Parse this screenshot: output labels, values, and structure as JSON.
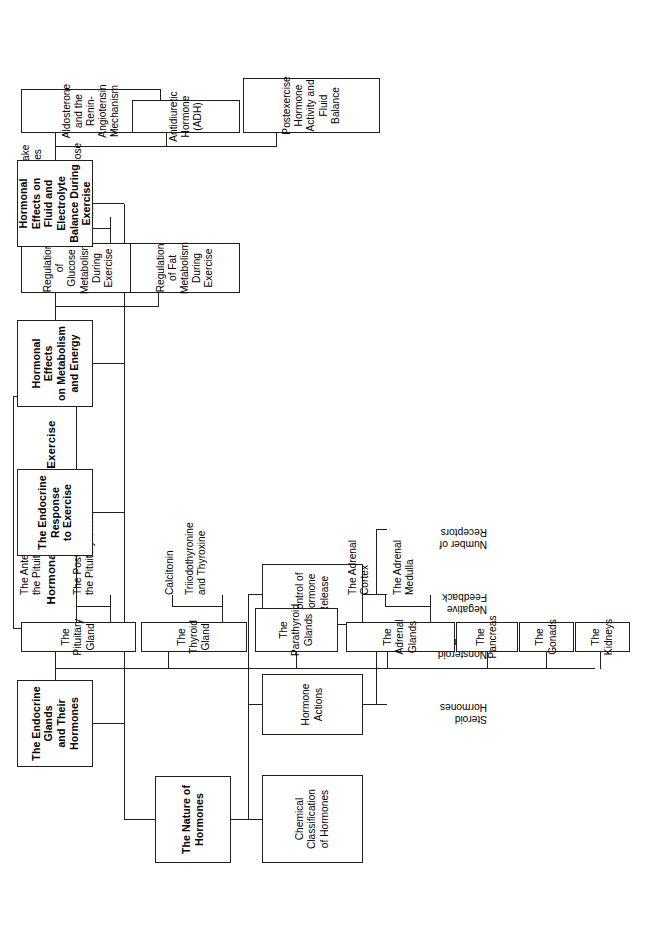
{
  "diagram": {
    "type": "hierarchy-concept-map",
    "orientation": "rotated-90-counterclockwise",
    "line_color": "#231f20",
    "background_color": "#ffffff"
  },
  "root": {
    "line1": "Chapter 5",
    "line2": "Hormonal Regulation of Exercise",
    "text": "Chapter 5\nHormonal Regulation of Exercise"
  },
  "branches": [
    {
      "id": "nature-of-hormones",
      "label": "The Nature of\nHormones",
      "children": [
        {
          "id": "chemical-classification",
          "label": "Chemical\nClassification\nof Hormones",
          "children": []
        },
        {
          "id": "hormone-actions",
          "label": "Hormone Actions",
          "children": [
            {
              "id": "steroid-hormones",
              "label": "Steroid\nHormones"
            },
            {
              "id": "nonsteroid-hormones",
              "label": "Nonsteroid\nHormones"
            }
          ]
        },
        {
          "id": "control-of-hormone-release",
          "label": "Control of Hormone\nRelease",
          "children": [
            {
              "id": "negative-feedback",
              "label": "Negative\nFeedback"
            },
            {
              "id": "number-of-receptors",
              "label": "Number of\nReceptors"
            }
          ]
        }
      ]
    },
    {
      "id": "endocrine-glands",
      "label": "The Endocrine Glands\nand Their Hormones",
      "children": [
        {
          "id": "pituitary-gland",
          "label": "The Pituitary Gland",
          "children": [
            {
              "id": "posterior-lobe",
              "label": "The Posterior Lobe of\nthe Pituitary Gland"
            },
            {
              "id": "anterior-lobe",
              "label": "The Anterior Lobe of\nthe Pituitary Gland"
            }
          ]
        },
        {
          "id": "thyroid-gland",
          "label": "The Thyroid Gland",
          "children": [
            {
              "id": "triiodothyronine-thyroxine",
              "label": "Triiodothyronine\nand Thyroxine"
            },
            {
              "id": "calcitonin",
              "label": "Calcitonin"
            }
          ]
        },
        {
          "id": "parathyroid-glands",
          "label": "The Parathyroid\nGlands",
          "children": []
        },
        {
          "id": "adrenal-glands",
          "label": "The Adrenal Glands",
          "children": [
            {
              "id": "adrenal-medulla",
              "label": "The Adrenal\nMedulla"
            },
            {
              "id": "adrenal-cortex",
              "label": "The Adrenal\nCortex"
            }
          ]
        },
        {
          "id": "pancreas",
          "label": "The Pancreas",
          "children": []
        },
        {
          "id": "gonads",
          "label": "The Gonads",
          "children": []
        },
        {
          "id": "kidneys",
          "label": "The Kidneys",
          "children": []
        }
      ]
    },
    {
      "id": "endocrine-response",
      "label": "The Endocrine\nResponse\nto Exercise",
      "children": []
    },
    {
      "id": "metabolism-energy",
      "label": "Hormonal Effects\non Metabolism\nand Energy",
      "children": [
        {
          "id": "glucose-regulation",
          "label": "Regulation of\nGlucose\nMetabolism\nDuring Exercise",
          "children": [
            {
              "id": "plasma-glucose-levels",
              "label": "Plasma Glucose\nLevels"
            },
            {
              "id": "glucose-uptake",
              "label": "Glucose Uptake\nby the Muscles"
            }
          ]
        },
        {
          "id": "fat-regulation",
          "label": "Regulation\nof Fat\nMetabolism\nDuring Exercise",
          "children": []
        }
      ]
    },
    {
      "id": "fluid-electrolyte",
      "label": "Hormonal Effects on\nFluid and Electrolyte\nBalance During\nExercise",
      "children": [
        {
          "id": "aldosterone-renin",
          "label": "Aldosterone and the\nRenin-Angiotensin\nMechanism",
          "children": []
        },
        {
          "id": "adh",
          "label": "Antidiuretic\nHormone (ADH)",
          "children": []
        },
        {
          "id": "postexercise",
          "label": "Postexercise\nHormone\nActivity and Fluid\nBalance",
          "children": []
        }
      ]
    }
  ]
}
